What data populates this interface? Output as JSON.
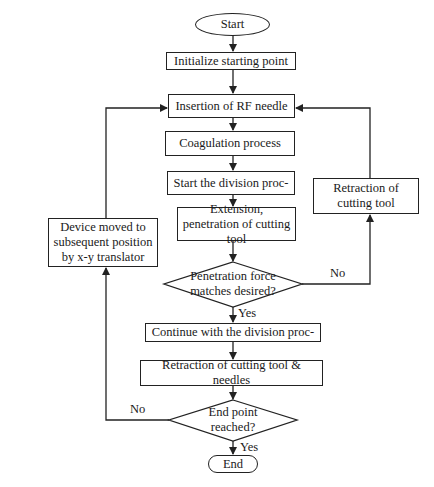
{
  "flowchart": {
    "start": {
      "label": "Start"
    },
    "steps": [
      {
        "id": "init",
        "label": "Initialize starting point"
      },
      {
        "id": "insert",
        "label": "Insertion of RF needle"
      },
      {
        "id": "coag",
        "label": "Coagulation process"
      },
      {
        "id": "startdiv",
        "label": "Start the division proc-"
      },
      {
        "id": "extend",
        "label": "Extension, penetration of cutting tool"
      },
      {
        "id": "continue",
        "label": "Continue with the division proc-"
      },
      {
        "id": "retract_all",
        "label": "Retraction of cutting tool & needles"
      }
    ],
    "side_steps": {
      "retract_tool": {
        "label": "Retraction of cutting tool"
      },
      "device_move": {
        "label": "Device moved to subsequent position by x-y translator"
      }
    },
    "decisions": [
      {
        "id": "force",
        "label": "Penetration force matches desired?",
        "yes": "Yes",
        "no": "No"
      },
      {
        "id": "endpoint",
        "label": "End point reached?",
        "yes": "Yes",
        "no": "No"
      }
    ],
    "end": {
      "label": "End"
    }
  },
  "colors": {
    "stroke": "#222222",
    "background": "#ffffff",
    "text": "#1a1a1a"
  }
}
